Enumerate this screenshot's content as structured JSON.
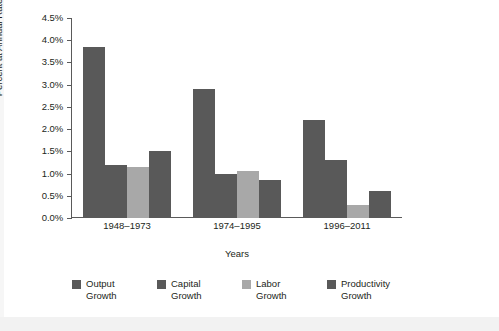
{
  "chart_data": {
    "type": "bar",
    "title": "",
    "xlabel": "Years",
    "ylabel": "Percent at Annual Rate",
    "categories": [
      "1948–1973",
      "1974–1995",
      "1996–2011"
    ],
    "series": [
      {
        "name": "Output\nGrowth",
        "legend_label": "Output\nGrowth",
        "color": "#595959",
        "values": [
          3.85,
          2.9,
          2.2
        ]
      },
      {
        "name": "Capital\nGrowth",
        "legend_label": "Capital\nGrowth",
        "color": "#595959",
        "values": [
          1.2,
          1.0,
          1.3
        ]
      },
      {
        "name": "Labor\nGrowth",
        "legend_label": "Labor\nGrowth",
        "color": "#a8a8a8",
        "values": [
          1.15,
          1.05,
          0.3
        ]
      },
      {
        "name": "Productivity\nGrowth",
        "legend_label": "Productivity\nGrowth",
        "color": "#595959",
        "values": [
          1.5,
          0.85,
          0.6
        ]
      }
    ],
    "ylim": [
      0.0,
      4.5
    ],
    "ytick_labels": [
      "0.0%",
      "0.5%",
      "1.0%",
      "1.5%",
      "2.0%",
      "2.5%",
      "3.0%",
      "3.5%",
      "4.0%",
      "4.5%"
    ],
    "ytick_values": [
      0.0,
      0.5,
      1.0,
      1.5,
      2.0,
      2.5,
      3.0,
      3.5,
      4.0,
      4.5
    ],
    "grid": false,
    "legend_position": "bottom",
    "axis_color": "#5a5a5a"
  }
}
